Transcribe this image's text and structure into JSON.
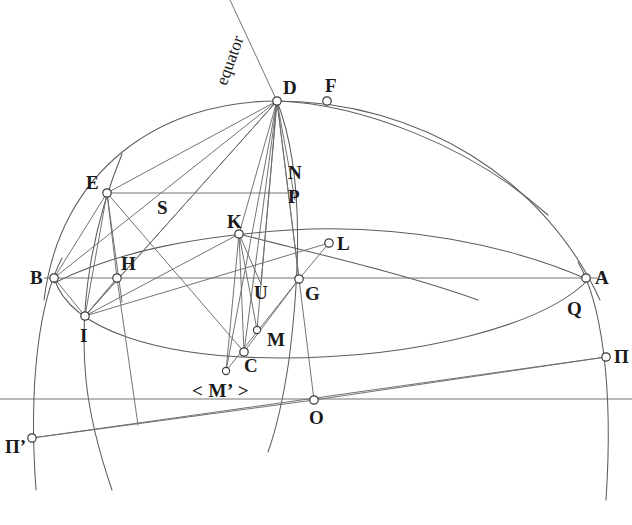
{
  "figure": {
    "type": "geometric-diagram",
    "background_color": "#ffffff",
    "line_color": "#5d5d5d",
    "label_color": "#1a1a1a",
    "width": 632,
    "height": 525
  },
  "annotations": {
    "equator_label": "equator",
    "m_prime_label": "< M’ >"
  },
  "points": [
    {
      "id": "D",
      "label": "D",
      "x": 277,
      "y": 101,
      "r": 4.2,
      "label_x": 283,
      "label_y": 78
    },
    {
      "id": "F",
      "label": "F",
      "x": 327,
      "y": 101,
      "r": 4.2,
      "label_x": 325,
      "label_y": 76
    },
    {
      "id": "E",
      "label": "E",
      "x": 107,
      "y": 193,
      "r": 4.2,
      "label_x": 86,
      "label_y": 173
    },
    {
      "id": "N",
      "label": "N",
      "x": 295,
      "y": 193,
      "r": 0,
      "label_x": 288,
      "label_y": 163
    },
    {
      "id": "P",
      "label": "P",
      "x": 295,
      "y": 200,
      "r": 0,
      "label_x": 288,
      "label_y": 187
    },
    {
      "id": "S",
      "label": "S",
      "x": 164,
      "y": 208,
      "r": 0,
      "label_x": 157,
      "label_y": 198
    },
    {
      "id": "K",
      "label": "K",
      "x": 239,
      "y": 234,
      "r": 4.2,
      "label_x": 227,
      "label_y": 212
    },
    {
      "id": "L",
      "label": "L",
      "x": 329,
      "y": 243,
      "r": 4.2,
      "label_x": 337,
      "label_y": 234
    },
    {
      "id": "B",
      "label": "B",
      "x": 54,
      "y": 278,
      "r": 4.2,
      "label_x": 30,
      "label_y": 268
    },
    {
      "id": "H",
      "label": "H",
      "x": 117,
      "y": 278,
      "r": 4.2,
      "label_x": 121,
      "label_y": 254
    },
    {
      "id": "A",
      "label": "A",
      "x": 586,
      "y": 278,
      "r": 4.2,
      "label_x": 595,
      "label_y": 268
    },
    {
      "id": "G",
      "label": "G",
      "x": 299,
      "y": 279,
      "r": 4.2,
      "label_x": 305,
      "label_y": 284
    },
    {
      "id": "U",
      "label": "U",
      "x": 261,
      "y": 284,
      "r": 0,
      "label_x": 254,
      "label_y": 283
    },
    {
      "id": "Q",
      "label": "Q",
      "x": 575,
      "y": 299,
      "r": 0,
      "label_x": 567,
      "label_y": 299
    },
    {
      "id": "I",
      "label": "I",
      "x": 85,
      "y": 316,
      "r": 4.2,
      "label_x": 80,
      "label_y": 326
    },
    {
      "id": "Mt",
      "label": "M",
      "x": 257,
      "y": 330,
      "r": 3.6,
      "label_x": 267,
      "label_y": 330
    },
    {
      "id": "C",
      "label": "C",
      "x": 244,
      "y": 352,
      "r": 4.2,
      "label_x": 244,
      "label_y": 356
    },
    {
      "id": "Pi",
      "label": "П",
      "x": 606,
      "y": 357,
      "r": 4.2,
      "label_x": 614,
      "label_y": 347
    },
    {
      "id": "Mp",
      "label": "",
      "x": 226,
      "y": 371,
      "r": 3.6,
      "label_x": 0,
      "label_y": 0
    },
    {
      "id": "O",
      "label": "O",
      "x": 314,
      "y": 400,
      "r": 4.2,
      "label_x": 309,
      "label_y": 408
    },
    {
      "id": "Pip",
      "label": "П’",
      "x": 32,
      "y": 438,
      "r": 4.2,
      "label_x": 5,
      "label_y": 437
    }
  ],
  "lines": [
    {
      "name": "chord-B-A-horizontal",
      "x1": 44,
      "y1": 278,
      "x2": 597,
      "y2": 278
    },
    {
      "name": "chord-E-N-horizontal",
      "x1": 107,
      "y1": 193,
      "x2": 296,
      "y2": 193
    },
    {
      "name": "baseline-horizontal",
      "x1": 0,
      "y1": 399,
      "x2": 632,
      "y2": 399
    },
    {
      "name": "line-Piprime-Pi",
      "x1": 32,
      "y1": 438,
      "x2": 606,
      "y2": 357
    },
    {
      "name": "line-Piprime-O",
      "x1": 32,
      "y1": 438,
      "x2": 314,
      "y2": 400
    },
    {
      "name": "line-O-Pi",
      "x1": 314,
      "y1": 400,
      "x2": 606,
      "y2": 357
    },
    {
      "name": "line-D-E",
      "x1": 277,
      "y1": 101,
      "x2": 107,
      "y2": 193
    },
    {
      "name": "line-D-B",
      "x1": 277,
      "y1": 101,
      "x2": 54,
      "y2": 278
    },
    {
      "name": "line-D-I",
      "x1": 277,
      "y1": 101,
      "x2": 85,
      "y2": 316
    },
    {
      "name": "line-D-K",
      "x1": 277,
      "y1": 101,
      "x2": 239,
      "y2": 234
    },
    {
      "name": "line-D-C",
      "x1": 277,
      "y1": 101,
      "x2": 244,
      "y2": 352
    },
    {
      "name": "line-D-Mprime",
      "x1": 277,
      "y1": 101,
      "x2": 226,
      "y2": 371
    },
    {
      "name": "line-D-U",
      "x1": 277,
      "y1": 101,
      "x2": 261,
      "y2": 284
    },
    {
      "name": "line-D-M",
      "x1": 277,
      "y1": 101,
      "x2": 257,
      "y2": 330
    },
    {
      "name": "line-D-G",
      "x1": 277,
      "y1": 101,
      "x2": 299,
      "y2": 279
    },
    {
      "name": "line-D-P",
      "x1": 277,
      "y1": 101,
      "x2": 295,
      "y2": 200
    },
    {
      "name": "line-D-O",
      "x1": 277,
      "y1": 101,
      "x2": 314,
      "y2": 400
    },
    {
      "name": "line-equator-D",
      "x1": 277,
      "y1": 101,
      "x2": 230,
      "y2": 0
    },
    {
      "name": "line-E-I",
      "x1": 107,
      "y1": 193,
      "x2": 85,
      "y2": 316
    },
    {
      "name": "line-E-B",
      "x1": 107,
      "y1": 193,
      "x2": 54,
      "y2": 278
    },
    {
      "name": "line-E-H",
      "x1": 107,
      "y1": 193,
      "x2": 117,
      "y2": 278
    },
    {
      "name": "line-E-Hdown",
      "x1": 107,
      "y1": 193,
      "x2": 122,
      "y2": 302
    },
    {
      "name": "line-E-C",
      "x1": 107,
      "y1": 193,
      "x2": 244,
      "y2": 352
    },
    {
      "name": "line-B-I",
      "x1": 54,
      "y1": 278,
      "x2": 85,
      "y2": 316
    },
    {
      "name": "line-I-H",
      "x1": 85,
      "y1": 316,
      "x2": 117,
      "y2": 278
    },
    {
      "name": "line-I-K",
      "x1": 85,
      "y1": 316,
      "x2": 239,
      "y2": 234
    },
    {
      "name": "line-I-L",
      "x1": 85,
      "y1": 316,
      "x2": 329,
      "y2": 243
    },
    {
      "name": "line-I-D",
      "x1": 85,
      "y1": 316,
      "x2": 277,
      "y2": 101
    },
    {
      "name": "line-H-down",
      "x1": 117,
      "y1": 278,
      "x2": 138,
      "y2": 425
    },
    {
      "name": "line-K-C",
      "x1": 239,
      "y1": 234,
      "x2": 244,
      "y2": 352
    },
    {
      "name": "line-K-M",
      "x1": 239,
      "y1": 234,
      "x2": 257,
      "y2": 330
    },
    {
      "name": "line-K-Mprime",
      "x1": 239,
      "y1": 234,
      "x2": 226,
      "y2": 371
    },
    {
      "name": "line-K-U",
      "x1": 239,
      "y1": 234,
      "x2": 261,
      "y2": 284
    },
    {
      "name": "line-L-G",
      "x1": 329,
      "y1": 243,
      "x2": 299,
      "y2": 279
    },
    {
      "name": "line-G-C",
      "x1": 299,
      "y1": 279,
      "x2": 244,
      "y2": 352
    },
    {
      "name": "line-G-Mprime",
      "x1": 299,
      "y1": 279,
      "x2": 226,
      "y2": 371
    }
  ],
  "curves": [
    {
      "name": "outer-dome-arc-B-D-A",
      "d": "M 44 300 C 60 170 160 101 277 101 C 420 101 545 180 600 300"
    },
    {
      "name": "inner-arc-E-K-L-A",
      "d": "M 54 283 C 120 250 200 236 290 230 C 400 223 510 245 589 280"
    },
    {
      "name": "lower-ellipse-B-C-A",
      "d": "M 54 278 C 70 330 160 358 280 358 C 420 358 545 325 589 279"
    },
    {
      "name": "left-meridian-B-Piprime",
      "d": "M 62 258 C 40 300 28 380 36 490"
    },
    {
      "name": "right-meridian-A-Pi",
      "d": "M 578 262 C 600 300 614 380 606 500"
    },
    {
      "name": "inner-meridian-D-C-down",
      "d": "M 277 101 C 300 160 303 250 289 360 C 283 400 276 430 268 452"
    },
    {
      "name": "meridian-I-arc",
      "d": "M 122 154 C 95 220 78 300 86 380 C 90 420 100 455 112 490"
    },
    {
      "name": "arc-K-inner-right",
      "d": "M 239 234 C 300 250 400 272 478 300"
    },
    {
      "name": "arc-D-F-right",
      "d": "M 277 101 C 360 104 470 145 548 215"
    }
  ]
}
